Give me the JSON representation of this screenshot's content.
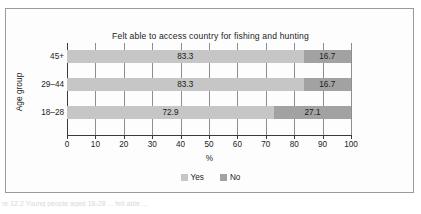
{
  "figure": {
    "caption": "re 12.2   Young people aged 18-28 ... felt able ..."
  },
  "legend": {
    "position": "bottom",
    "items": [
      {
        "label": "Yes",
        "color": "#c6c6c6"
      },
      {
        "label": "No",
        "color": "#a2a2a2"
      }
    ]
  },
  "chart_data": {
    "type": "bar",
    "orientation": "horizontal",
    "stacked": true,
    "title": "Felt able to access country for fishing and hunting",
    "xlabel": "%",
    "ylabel": "Age group",
    "categories": [
      "45+",
      "29–44",
      "18–28"
    ],
    "xticks": [
      0,
      10,
      20,
      30,
      40,
      50,
      60,
      70,
      80,
      90,
      100
    ],
    "xlim": [
      0,
      100
    ],
    "grid": true,
    "series": [
      {
        "name": "Yes",
        "color": "#c6c6c6",
        "values": [
          83.3,
          83.3,
          72.9
        ]
      },
      {
        "name": "No",
        "color": "#a2a2a2",
        "values": [
          16.7,
          16.7,
          27.1
        ]
      }
    ],
    "data_labels": [
      {
        "category": "45+",
        "yes": "83.3",
        "no": "16.7"
      },
      {
        "category": "29–44",
        "yes": "83.3",
        "no": "16.7"
      },
      {
        "category": "18–28",
        "yes": "72.9",
        "no": "27.1"
      }
    ]
  }
}
